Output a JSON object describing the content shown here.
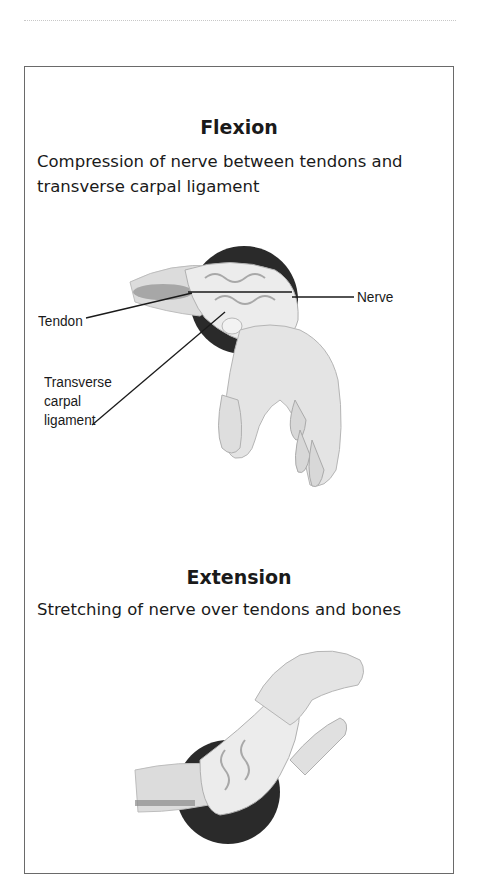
{
  "panels": [
    {
      "title": "Flexion",
      "description": "Compression of nerve between tendons and transverse carpal ligament",
      "labels": {
        "tendon": "Tendon",
        "nerve": "Nerve",
        "ligament_line1": "Transverse",
        "ligament_line2": "carpal",
        "ligament_line3": "ligament"
      },
      "illustration": "wrist-flexion-cross-section"
    },
    {
      "title": "Extension",
      "description": "Stretching of nerve over tendons and bones",
      "illustration": "wrist-extension-cross-section"
    }
  ],
  "colors": {
    "frame": "#6a6a6a",
    "highlight_circle": "#2a2a2a",
    "skin": "#e6e6e6",
    "text": "#1a1a1a"
  }
}
